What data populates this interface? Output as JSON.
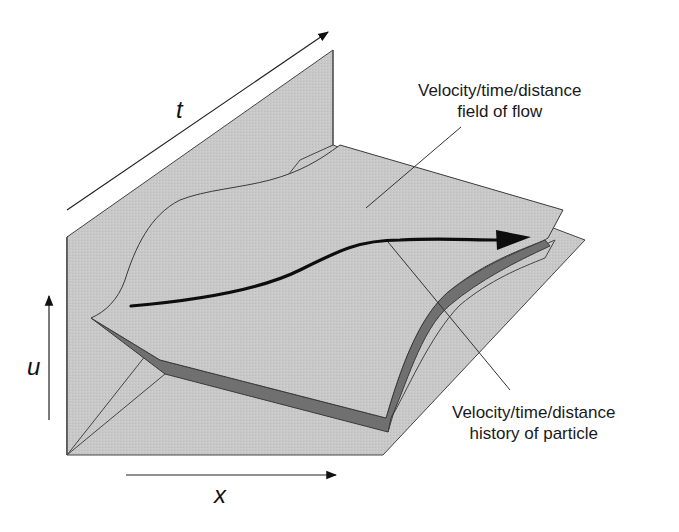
{
  "figure": {
    "type": "3d-surface-diagram",
    "colors": {
      "background": "#ffffff",
      "plane_fill": "#c9c9c9",
      "surface_fill": "#c6c6c6",
      "surface_underside": "#6f6f6f",
      "edge_stroke": "#3a3a3a",
      "particle_path": "#0d0d0d",
      "text": "#1a1a1a"
    }
  },
  "axes": {
    "t": {
      "label": "t",
      "direction": "depth (diagonal, up-right)"
    },
    "u": {
      "label": "u",
      "direction": "vertical (up)"
    },
    "x": {
      "label": "x",
      "direction": "horizontal (right)"
    }
  },
  "annotations": {
    "field": {
      "line1": "Velocity/time/distance",
      "line2": "field of flow"
    },
    "history": {
      "line1": "Velocity/time/distance",
      "line2": "history of particle"
    }
  },
  "elements": {
    "back_plane": "Vertical u–t plane",
    "floor_plane": "Horizontal x–t plane",
    "surface": "Curved velocity surface over x–t plane",
    "particle_path": "Thick arrow curve on surface showing particle trajectory"
  }
}
